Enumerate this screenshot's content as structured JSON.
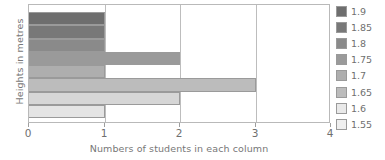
{
  "chart_data": {
    "type": "bar",
    "orientation": "horizontal",
    "title": "",
    "xlabel": "Numbers of students in each column",
    "ylabel": "Heights in metres",
    "categories": [
      "1.9",
      "1.85",
      "1.8",
      "1.75",
      "1.7",
      "1.65",
      "1.6",
      "1.55"
    ],
    "values": [
      1,
      1,
      1,
      2,
      1,
      3,
      2,
      1
    ],
    "xlim": [
      0,
      4
    ],
    "xticks": [
      "0",
      "1",
      "2",
      "3",
      "4"
    ],
    "grid": true,
    "legend_position": "right",
    "series": [
      {
        "name": "Students",
        "values": [
          1,
          1,
          1,
          2,
          1,
          3,
          2,
          1
        ]
      }
    ],
    "bar_colors": [
      "#6e6e6e",
      "#787878",
      "#8a8a8a",
      "#9a9a9a",
      "#aeaeae",
      "#bcbcbc",
      "#d6d6d6",
      "#e4e4e4"
    ]
  },
  "legend": {
    "items": [
      {
        "label": "1.9",
        "color": "#6e6e6e"
      },
      {
        "label": "1.85",
        "color": "#787878"
      },
      {
        "label": "1.8",
        "color": "#8a8a8a"
      },
      {
        "label": "1.75",
        "color": "#9a9a9a"
      },
      {
        "label": "1.7",
        "color": "#aeaeae"
      },
      {
        "label": "1.65",
        "color": "#bcbcbc"
      },
      {
        "label": "1.6",
        "color": "#e9e9e9"
      },
      {
        "label": "1.55",
        "color": "#efefef"
      }
    ]
  },
  "axes": {
    "x_title": "Numbers of students in each column",
    "y_title": "Heights in metres",
    "x_ticks": [
      "0",
      "1",
      "2",
      "3",
      "4"
    ]
  }
}
